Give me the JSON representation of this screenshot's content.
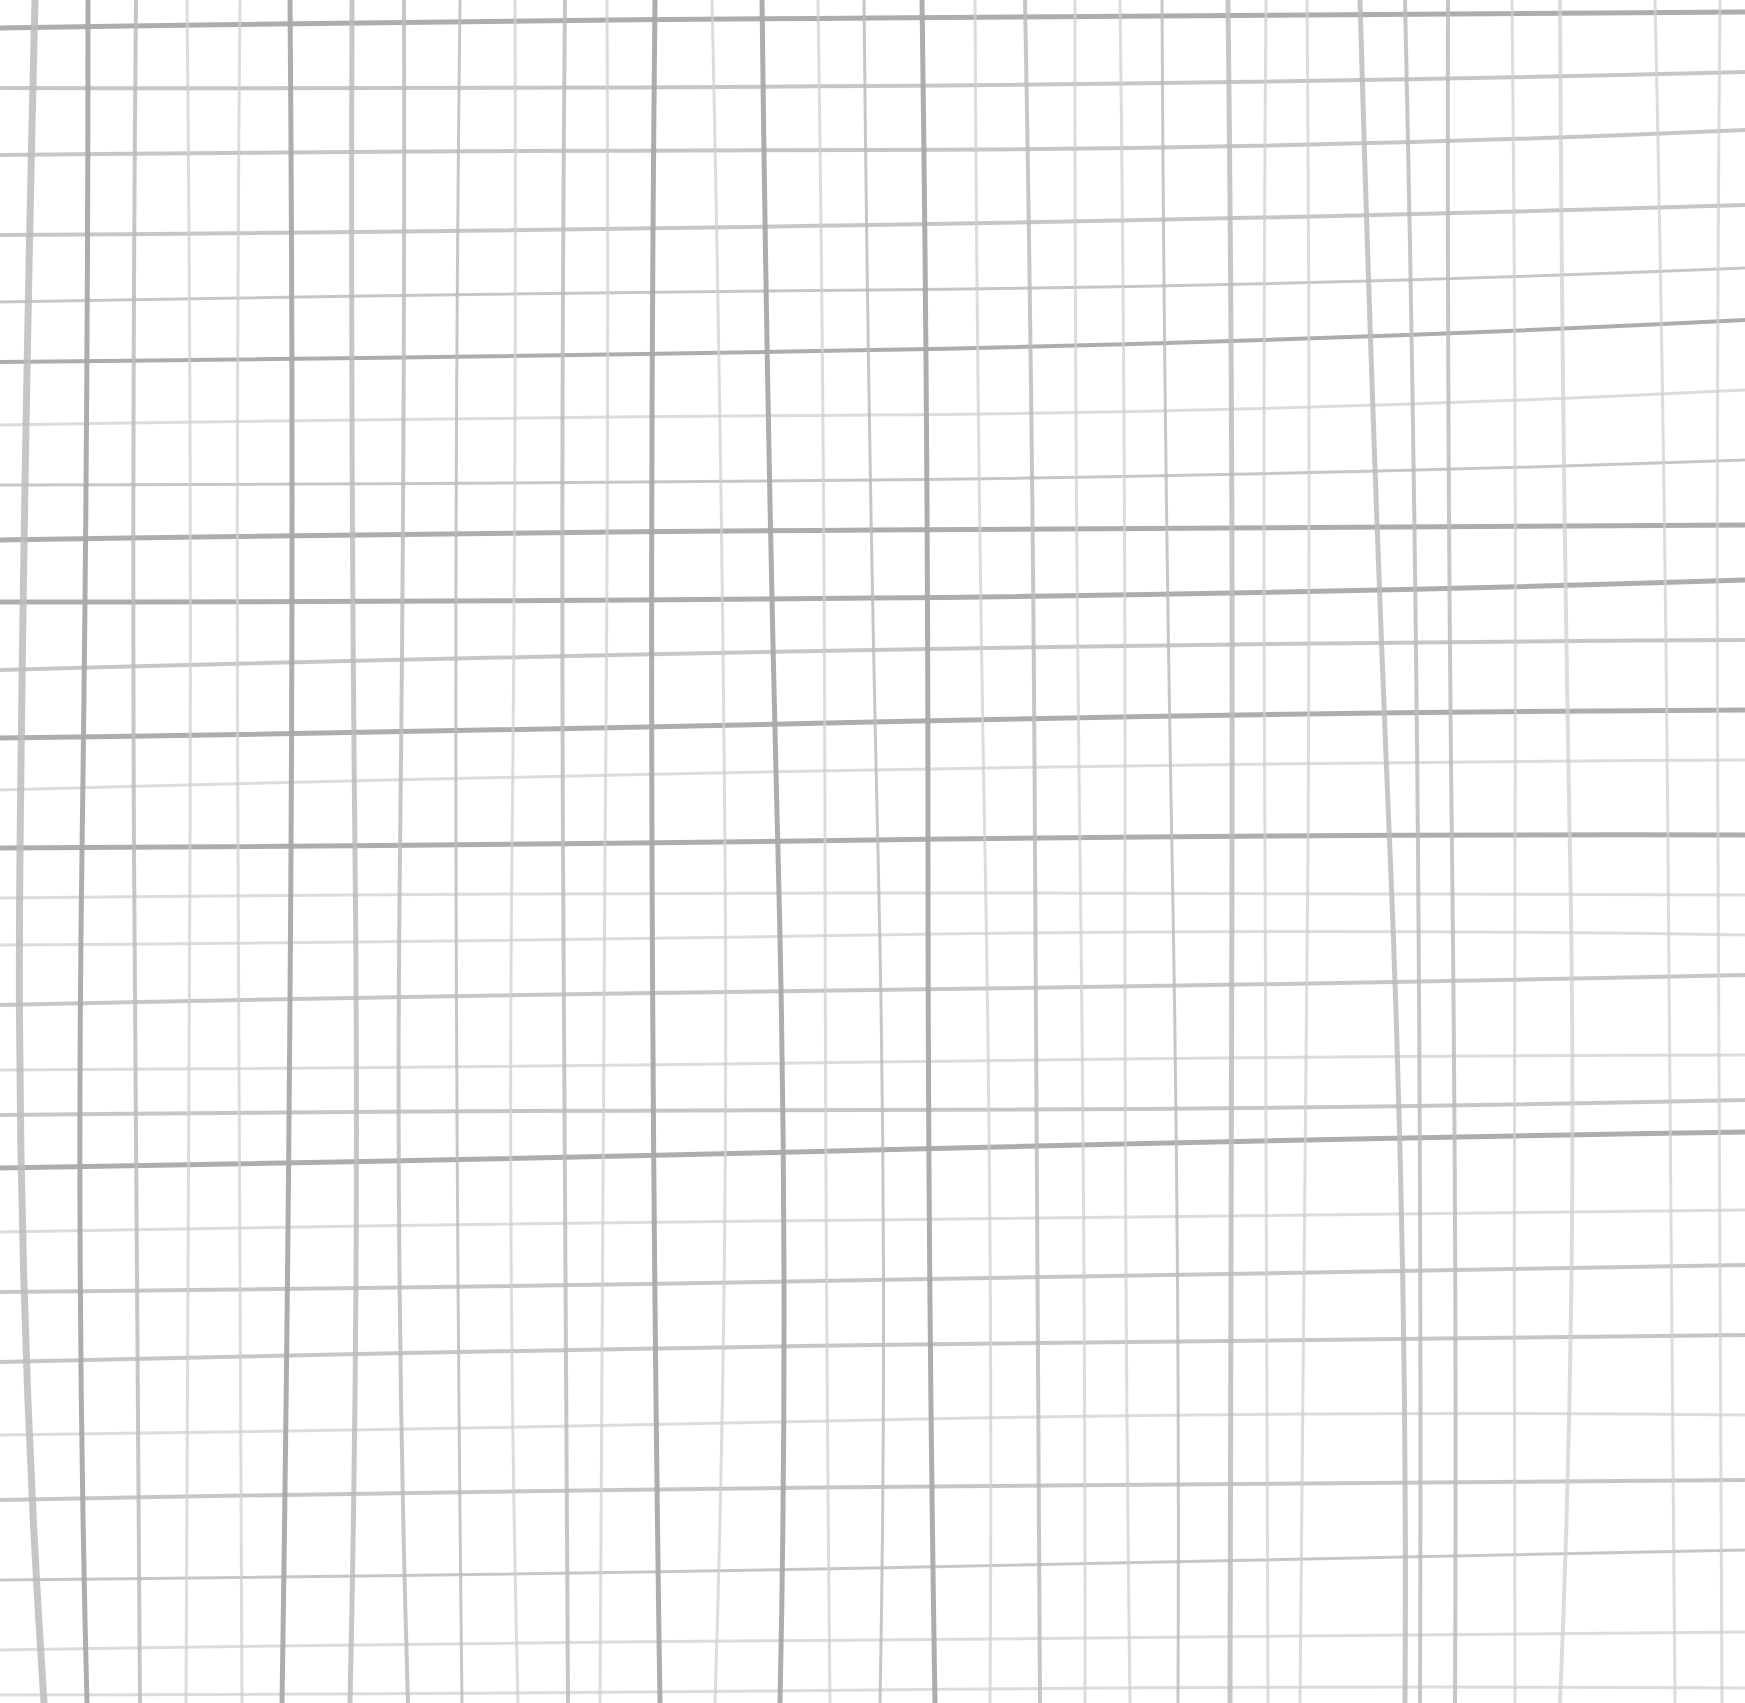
{
  "canvas": {
    "width": 1745,
    "height": 1703,
    "background": "#ffffff"
  },
  "pattern": {
    "type": "hand-drawn-grid",
    "line_color_dark": "#a9a9a9",
    "line_color_mid": "#bcbcbc",
    "line_color_light": "#d0d0d0",
    "vertical_lines": [
      {
        "x_top": 35,
        "x_mid": 20,
        "x_bot": 44,
        "w": 7,
        "tone": "mid"
      },
      {
        "x_top": 88,
        "x_mid": 82,
        "x_bot": 87,
        "w": 5,
        "tone": "dark"
      },
      {
        "x_top": 136,
        "x_mid": 134,
        "x_bot": 140,
        "w": 4,
        "tone": "mid"
      },
      {
        "x_top": 187,
        "x_mid": 190,
        "x_bot": 186,
        "w": 3,
        "tone": "light"
      },
      {
        "x_top": 240,
        "x_mid": 238,
        "x_bot": 242,
        "w": 3,
        "tone": "light"
      },
      {
        "x_top": 290,
        "x_mid": 291,
        "x_bot": 282,
        "w": 5,
        "tone": "dark"
      },
      {
        "x_top": 352,
        "x_mid": 355,
        "x_bot": 350,
        "w": 5,
        "tone": "mid"
      },
      {
        "x_top": 404,
        "x_mid": 400,
        "x_bot": 408,
        "w": 4,
        "tone": "mid"
      },
      {
        "x_top": 460,
        "x_mid": 456,
        "x_bot": 462,
        "w": 3,
        "tone": "mid"
      },
      {
        "x_top": 515,
        "x_mid": 512,
        "x_bot": 518,
        "w": 3,
        "tone": "light"
      },
      {
        "x_top": 565,
        "x_mid": 563,
        "x_bot": 568,
        "w": 4,
        "tone": "mid"
      },
      {
        "x_top": 607,
        "x_mid": 605,
        "x_bot": 600,
        "w": 3,
        "tone": "light"
      },
      {
        "x_top": 655,
        "x_mid": 652,
        "x_bot": 660,
        "w": 5,
        "tone": "dark"
      },
      {
        "x_top": 712,
        "x_mid": 725,
        "x_bot": 715,
        "w": 3,
        "tone": "light"
      },
      {
        "x_top": 762,
        "x_mid": 778,
        "x_bot": 780,
        "w": 5,
        "tone": "dark"
      },
      {
        "x_top": 818,
        "x_mid": 825,
        "x_bot": 830,
        "w": 3,
        "tone": "light"
      },
      {
        "x_top": 864,
        "x_mid": 878,
        "x_bot": 880,
        "w": 3,
        "tone": "mid"
      },
      {
        "x_top": 922,
        "x_mid": 928,
        "x_bot": 935,
        "w": 5,
        "tone": "dark"
      },
      {
        "x_top": 975,
        "x_mid": 985,
        "x_bot": 990,
        "w": 3,
        "tone": "light"
      },
      {
        "x_top": 1025,
        "x_mid": 1035,
        "x_bot": 1040,
        "w": 4,
        "tone": "mid"
      },
      {
        "x_top": 1075,
        "x_mid": 1080,
        "x_bot": 1085,
        "w": 3,
        "tone": "light"
      },
      {
        "x_top": 1120,
        "x_mid": 1125,
        "x_bot": 1130,
        "w": 3,
        "tone": "light"
      },
      {
        "x_top": 1162,
        "x_mid": 1172,
        "x_bot": 1178,
        "w": 3,
        "tone": "mid"
      },
      {
        "x_top": 1228,
        "x_mid": 1232,
        "x_bot": 1230,
        "w": 5,
        "tone": "mid"
      },
      {
        "x_top": 1266,
        "x_mid": 1265,
        "x_bot": 1268,
        "w": 3,
        "tone": "light"
      },
      {
        "x_top": 1307,
        "x_mid": 1308,
        "x_bot": 1300,
        "w": 3,
        "tone": "light"
      },
      {
        "x_top": 1360,
        "x_mid": 1390,
        "x_bot": 1405,
        "w": 5,
        "tone": "mid"
      },
      {
        "x_top": 1405,
        "x_mid": 1418,
        "x_bot": 1420,
        "w": 4,
        "tone": "mid"
      },
      {
        "x_top": 1448,
        "x_mid": 1452,
        "x_bot": 1455,
        "w": 4,
        "tone": "mid"
      },
      {
        "x_top": 1512,
        "x_mid": 1515,
        "x_bot": 1515,
        "w": 3,
        "tone": "light"
      },
      {
        "x_top": 1560,
        "x_mid": 1570,
        "x_bot": 1560,
        "w": 4,
        "tone": "light"
      },
      {
        "x_top": 1655,
        "x_mid": 1668,
        "x_bot": 1675,
        "w": 3,
        "tone": "light"
      },
      {
        "x_top": 1720,
        "x_mid": 1718,
        "x_bot": 1722,
        "w": 3,
        "tone": "light"
      }
    ],
    "horizontal_lines": [
      {
        "y_left": 28,
        "y_mid": 18,
        "y_right": 12,
        "w": 5,
        "tone": "dark"
      },
      {
        "y_left": 88,
        "y_mid": 86,
        "y_right": 72,
        "w": 4,
        "tone": "mid"
      },
      {
        "y_left": 155,
        "y_mid": 150,
        "y_right": 130,
        "w": 4,
        "tone": "mid"
      },
      {
        "y_left": 235,
        "y_mid": 225,
        "y_right": 205,
        "w": 4,
        "tone": "mid"
      },
      {
        "y_left": 302,
        "y_mid": 290,
        "y_right": 268,
        "w": 3,
        "tone": "mid"
      },
      {
        "y_left": 362,
        "y_mid": 350,
        "y_right": 320,
        "w": 4,
        "tone": "dark"
      },
      {
        "y_left": 425,
        "y_mid": 415,
        "y_right": 390,
        "w": 3,
        "tone": "light"
      },
      {
        "y_left": 485,
        "y_mid": 480,
        "y_right": 460,
        "w": 3,
        "tone": "mid"
      },
      {
        "y_left": 540,
        "y_mid": 530,
        "y_right": 525,
        "w": 5,
        "tone": "dark"
      },
      {
        "y_left": 602,
        "y_mid": 598,
        "y_right": 580,
        "w": 5,
        "tone": "dark"
      },
      {
        "y_left": 670,
        "y_mid": 650,
        "y_right": 640,
        "w": 4,
        "tone": "mid"
      },
      {
        "y_left": 738,
        "y_mid": 722,
        "y_right": 710,
        "w": 5,
        "tone": "dark"
      },
      {
        "y_left": 790,
        "y_mid": 770,
        "y_right": 760,
        "w": 3,
        "tone": "light"
      },
      {
        "y_left": 848,
        "y_mid": 840,
        "y_right": 835,
        "w": 5,
        "tone": "dark"
      },
      {
        "y_left": 898,
        "y_mid": 893,
        "y_right": 895,
        "w": 3,
        "tone": "light"
      },
      {
        "y_left": 945,
        "y_mid": 935,
        "y_right": 935,
        "w": 3,
        "tone": "light"
      },
      {
        "y_left": 1005,
        "y_mid": 990,
        "y_right": 975,
        "w": 4,
        "tone": "mid"
      },
      {
        "y_left": 1070,
        "y_mid": 1062,
        "y_right": 1055,
        "w": 3,
        "tone": "light"
      },
      {
        "y_left": 1115,
        "y_mid": 1110,
        "y_right": 1100,
        "w": 4,
        "tone": "mid"
      },
      {
        "y_left": 1168,
        "y_mid": 1150,
        "y_right": 1132,
        "w": 5,
        "tone": "dark"
      },
      {
        "y_left": 1232,
        "y_mid": 1220,
        "y_right": 1210,
        "w": 3,
        "tone": "light"
      },
      {
        "y_left": 1292,
        "y_mid": 1280,
        "y_right": 1265,
        "w": 4,
        "tone": "mid"
      },
      {
        "y_left": 1362,
        "y_mid": 1345,
        "y_right": 1335,
        "w": 4,
        "tone": "mid"
      },
      {
        "y_left": 1435,
        "y_mid": 1420,
        "y_right": 1415,
        "w": 3,
        "tone": "light"
      },
      {
        "y_left": 1500,
        "y_mid": 1487,
        "y_right": 1480,
        "w": 4,
        "tone": "mid"
      },
      {
        "y_left": 1580,
        "y_mid": 1568,
        "y_right": 1550,
        "w": 3,
        "tone": "mid"
      },
      {
        "y_left": 1650,
        "y_mid": 1640,
        "y_right": 1632,
        "w": 3,
        "tone": "light"
      },
      {
        "y_left": 1695,
        "y_mid": 1690,
        "y_right": 1688,
        "w": 3,
        "tone": "light"
      }
    ]
  }
}
